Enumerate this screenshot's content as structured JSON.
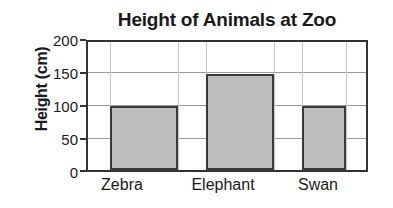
{
  "chart_data": {
    "type": "bar",
    "title": "Height of Animals at Zoo",
    "xlabel": "",
    "ylabel": "Height (cm)",
    "categories": [
      "Zebra",
      "Elephant",
      "Swan"
    ],
    "values": [
      100,
      150,
      100
    ],
    "ylim": [
      0,
      200
    ],
    "yticks": [
      0,
      50,
      100,
      150,
      200
    ],
    "ytick_labels": [
      "0",
      "50",
      "100",
      "150",
      "200"
    ],
    "grid": true,
    "legend": false,
    "bar_color": "#bdbdbd",
    "bar_edge_color": "#3a3a3a",
    "axis_color": "#333333",
    "gridline_color": "#9a9a9a",
    "background": "#ffffff"
  }
}
